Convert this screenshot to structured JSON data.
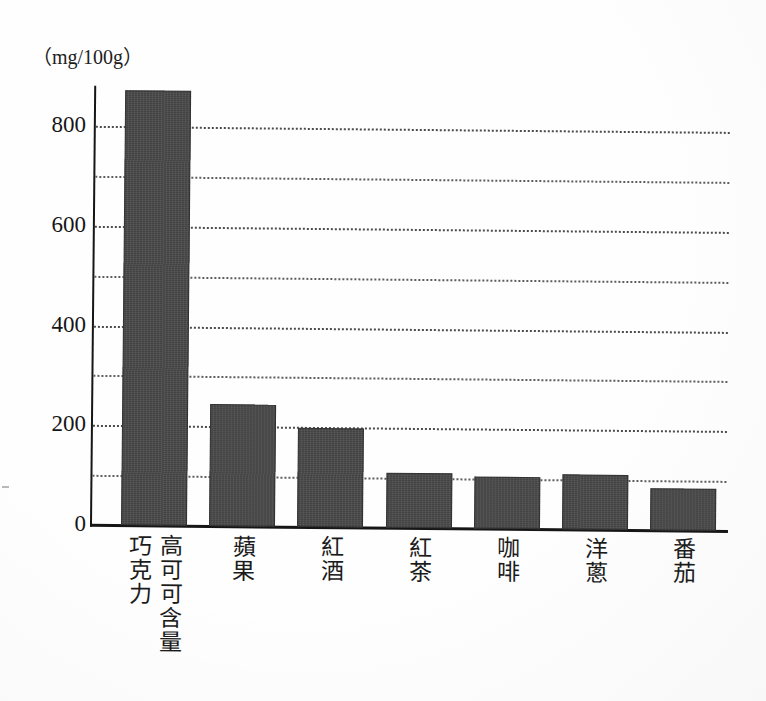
{
  "chart_data": {
    "type": "bar",
    "title": "",
    "subtitle": "",
    "xlabel": "",
    "ylabel": "",
    "unit_label": "（mg/100g）",
    "categories": [
      "高可可含量巧克力",
      "蘋果",
      "紅酒",
      "紅茶",
      "咖啡",
      "洋蔥",
      "番茄"
    ],
    "category_lines": [
      [
        "高可可含量",
        "巧克力"
      ],
      [
        "蘋果"
      ],
      [
        "紅酒"
      ],
      [
        "紅茶"
      ],
      [
        "咖啡"
      ],
      [
        "洋蔥"
      ],
      [
        "番茄"
      ]
    ],
    "values": [
      872,
      245,
      198,
      110,
      105,
      110,
      85
    ],
    "ylim": [
      0,
      880
    ],
    "ytick_labels": [
      "0",
      "200",
      "400",
      "600",
      "800"
    ],
    "ytick_values": [
      0,
      200,
      400,
      600,
      800
    ],
    "gridlines": [
      100,
      200,
      300,
      400,
      500,
      600,
      700,
      800
    ],
    "grid": true,
    "legend": "none",
    "bar_color": "#4a4a4a",
    "axis_color": "#161616",
    "grid_color": "#5d5d5d"
  }
}
